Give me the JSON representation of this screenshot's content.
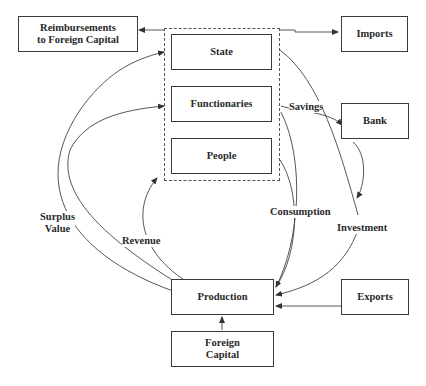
{
  "diagram": {
    "nodes": {
      "reimbursements": "Reimbursements to Foreign Capital",
      "reimbursements_line1": "Reimbursements",
      "reimbursements_line2": "to Foreign Capital",
      "state": "State",
      "functionaries": "Functionaries",
      "people": "People",
      "imports": "Imports",
      "bank": "Bank",
      "production": "Production",
      "exports": "Exports",
      "foreign_capital_line1": "Foreign",
      "foreign_capital_line2": "Capital"
    },
    "edge_labels": {
      "savings": "Savings",
      "surplus_value_line1": "Surplus",
      "surplus_value_line2": "Value",
      "revenue": "Revenue",
      "consumption": "Consumption",
      "investment": "Investment"
    },
    "edges": [
      {
        "from": "State group",
        "to": "Reimbursements to Foreign Capital",
        "label": ""
      },
      {
        "from": "State group",
        "to": "Imports",
        "label": ""
      },
      {
        "from": "Production",
        "to": "State",
        "label": "Surplus Value"
      },
      {
        "from": "Production",
        "to": "Functionaries",
        "label": "Surplus Value"
      },
      {
        "from": "Production",
        "to": "State group",
        "label": "Revenue"
      },
      {
        "from": "Functionaries",
        "to": "Bank",
        "label": "Savings"
      },
      {
        "from": "State",
        "to": "Bank",
        "label": ""
      },
      {
        "from": "Bank",
        "to": "Investment",
        "label": ""
      },
      {
        "from": "Investment",
        "to": "Production",
        "label": "Investment"
      },
      {
        "from": "Functionaries",
        "to": "Production",
        "label": "Consumption"
      },
      {
        "from": "People",
        "to": "Production",
        "label": "Consumption"
      },
      {
        "from": "Exports",
        "to": "Production",
        "label": ""
      },
      {
        "from": "Foreign Capital",
        "to": "Production",
        "label": ""
      }
    ]
  }
}
